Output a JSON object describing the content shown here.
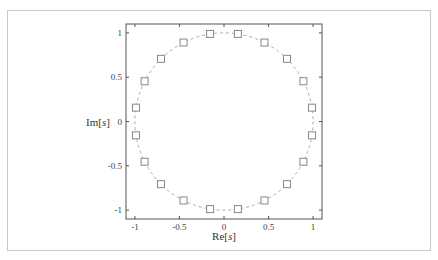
{
  "chart_data": {
    "type": "scatter",
    "title": "",
    "xlabel": "Re[s]",
    "ylabel": "Im[s]",
    "xlim": [
      -1.1,
      1.1
    ],
    "ylim": [
      -1.1,
      1.1
    ],
    "xticks": [
      -1,
      -0.5,
      0,
      0.5,
      1
    ],
    "yticks": [
      -1,
      -0.5,
      0,
      0.5,
      1
    ],
    "xtick_labels": [
      "-1",
      "-0.5",
      "0",
      "0.5",
      "1"
    ],
    "ytick_labels": [
      "-1",
      "-0.5",
      "0",
      "0.5",
      "1"
    ],
    "grid": false,
    "legend": null,
    "series": [
      {
        "name": "unit circle",
        "style": "dashed line",
        "color": "#aaaaaa",
        "shape": "circle",
        "center": [
          0,
          0
        ],
        "radius": 1
      },
      {
        "name": "points",
        "style": "hollow square markers",
        "color": "#888888",
        "points": [
          [
            0.988,
            0.156
          ],
          [
            0.891,
            0.454
          ],
          [
            0.707,
            0.707
          ],
          [
            0.454,
            0.891
          ],
          [
            0.156,
            0.988
          ],
          [
            -0.156,
            0.988
          ],
          [
            -0.454,
            0.891
          ],
          [
            -0.707,
            0.707
          ],
          [
            -0.891,
            0.454
          ],
          [
            -0.988,
            0.156
          ],
          [
            -0.988,
            -0.156
          ],
          [
            -0.891,
            -0.454
          ],
          [
            -0.707,
            -0.707
          ],
          [
            -0.454,
            -0.891
          ],
          [
            -0.156,
            -0.988
          ],
          [
            0.156,
            -0.988
          ],
          [
            0.454,
            -0.891
          ],
          [
            0.707,
            -0.707
          ],
          [
            0.891,
            -0.454
          ],
          [
            0.988,
            -0.156
          ]
        ]
      }
    ]
  },
  "labels": {
    "xlabel_main": "Re[",
    "xlabel_var": "s",
    "xlabel_end": "]",
    "ylabel_main": "Im[",
    "ylabel_var": "s",
    "ylabel_end": "]"
  }
}
